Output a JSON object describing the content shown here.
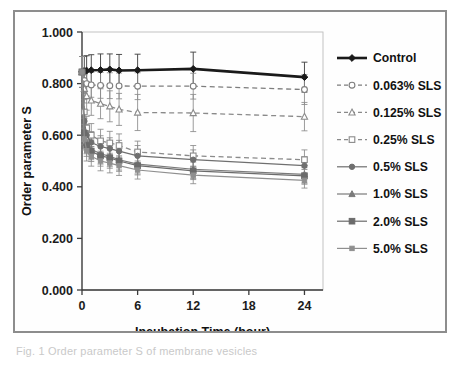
{
  "figure": {
    "caption_fragment": "Fig. 1 Order parameter S of membrane vesicles"
  },
  "chart_data": {
    "type": "line",
    "title": "",
    "xlabel": "Incubation Time (hour)",
    "ylabel": "Order parameter S",
    "xlim": [
      0,
      26
    ],
    "ylim": [
      0.0,
      1.0
    ],
    "xticks": [
      0,
      6,
      12,
      18,
      24
    ],
    "xtick_labels": [
      "0",
      "6",
      "12",
      "18",
      "24"
    ],
    "yticks": [
      0.0,
      0.2,
      0.4,
      0.6,
      0.8,
      1.0
    ],
    "ytick_labels": [
      "0.000",
      "0.200",
      "0.400",
      "0.600",
      "0.800",
      "1.000"
    ],
    "grid": false,
    "legend_position": "right",
    "error_bars": true,
    "x": [
      0,
      0.25,
      0.5,
      1,
      2,
      3,
      4,
      6,
      12,
      24
    ],
    "series": [
      {
        "name": "Control",
        "values": [
          0.845,
          0.848,
          0.85,
          0.852,
          0.853,
          0.855,
          0.851,
          0.852,
          0.857,
          0.825
        ],
        "errors": [
          0.06,
          0.058,
          0.058,
          0.06,
          0.062,
          0.06,
          0.062,
          0.062,
          0.065,
          0.058
        ],
        "color": "#1a1a1a",
        "line_style": "solid",
        "line_width": 2.6,
        "marker": "filled-diamond"
      },
      {
        "name": "0.063% SLS",
        "values": [
          0.845,
          0.812,
          0.8,
          0.795,
          0.793,
          0.792,
          0.791,
          0.79,
          0.79,
          0.777
        ],
        "errors": [
          0.06,
          0.05,
          0.048,
          0.048,
          0.05,
          0.05,
          0.05,
          0.052,
          0.05,
          0.058
        ],
        "color": "#7d7d7d",
        "line_style": "dashed",
        "line_width": 1.3,
        "marker": "open-circle"
      },
      {
        "name": "0.125% SLS",
        "values": [
          0.845,
          0.78,
          0.752,
          0.735,
          0.722,
          0.712,
          0.7,
          0.688,
          0.686,
          0.672
        ],
        "errors": [
          0.06,
          0.055,
          0.055,
          0.058,
          0.058,
          0.06,
          0.062,
          0.07,
          0.072,
          0.055
        ],
        "color": "#8a8a8a",
        "line_style": "dashed",
        "line_width": 1.3,
        "marker": "open-triangle"
      },
      {
        "name": "0.25% SLS",
        "values": [
          0.845,
          0.69,
          0.628,
          0.6,
          0.578,
          0.57,
          0.56,
          0.535,
          0.52,
          0.505
        ],
        "errors": [
          0.06,
          0.048,
          0.045,
          0.045,
          0.045,
          0.045,
          0.045,
          0.042,
          0.04,
          0.038
        ],
        "color": "#8a8a8a",
        "line_style": "dashed",
        "line_width": 1.3,
        "marker": "open-square"
      },
      {
        "name": "0.5% SLS",
        "values": [
          0.845,
          0.655,
          0.6,
          0.572,
          0.556,
          0.548,
          0.538,
          0.52,
          0.505,
          0.482
        ],
        "errors": [
          0.06,
          0.045,
          0.042,
          0.042,
          0.042,
          0.042,
          0.042,
          0.04,
          0.038,
          0.035
        ],
        "color": "#6f6f6f",
        "line_style": "solid",
        "line_width": 1.2,
        "marker": "filled-circle"
      },
      {
        "name": "1.0% SLS",
        "values": [
          0.845,
          0.62,
          0.57,
          0.545,
          0.528,
          0.518,
          0.505,
          0.488,
          0.468,
          0.448
        ],
        "errors": [
          0.06,
          0.045,
          0.042,
          0.04,
          0.04,
          0.04,
          0.04,
          0.038,
          0.036,
          0.034
        ],
        "color": "#7a7a7a",
        "line_style": "solid",
        "line_width": 1.2,
        "marker": "filled-triangle"
      },
      {
        "name": "2.0% SLS",
        "values": [
          0.845,
          0.608,
          0.56,
          0.538,
          0.52,
          0.512,
          0.5,
          0.482,
          0.462,
          0.442
        ],
        "errors": [
          0.06,
          0.045,
          0.042,
          0.04,
          0.04,
          0.04,
          0.04,
          0.036,
          0.034,
          0.032
        ],
        "color": "#6b6b6b",
        "line_style": "solid",
        "line_width": 1.2,
        "marker": "filled-square"
      },
      {
        "name": "5.0% SLS",
        "values": [
          0.845,
          0.585,
          0.54,
          0.518,
          0.5,
          0.492,
          0.482,
          0.465,
          0.445,
          0.425
        ],
        "errors": [
          0.06,
          0.042,
          0.04,
          0.038,
          0.038,
          0.038,
          0.038,
          0.035,
          0.033,
          0.03
        ],
        "color": "#8f8f8f",
        "line_style": "solid",
        "line_width": 1.2,
        "marker": "filled-small-square"
      }
    ]
  }
}
